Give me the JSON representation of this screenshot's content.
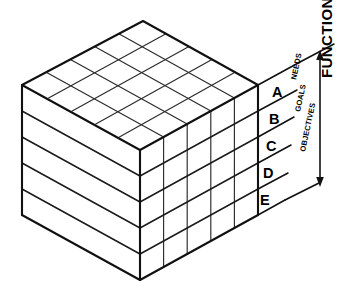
{
  "figure": {
    "background_color": "#ffffff",
    "line_color": "#111111"
  },
  "tier_labels": [
    {
      "id": "tier-a",
      "text": "A",
      "x": 272,
      "y": 97
    },
    {
      "id": "tier-b",
      "text": "B",
      "x": 269,
      "y": 124
    },
    {
      "id": "tier-c",
      "text": "C",
      "x": 266,
      "y": 151
    },
    {
      "id": "tier-d",
      "text": "D",
      "x": 263,
      "y": 178
    },
    {
      "id": "tier-e",
      "text": "E",
      "x": 260,
      "y": 205
    }
  ],
  "bracket_labels": [
    {
      "id": "label-needs",
      "text": "NEEDS",
      "x": 296,
      "y": 80
    },
    {
      "id": "label-goals",
      "text": "GOALS",
      "x": 300,
      "y": 112
    },
    {
      "id": "label-objectives",
      "text": "OBJECTIVES",
      "x": 305,
      "y": 146
    }
  ],
  "axis": {
    "title": "FUNCTIONS",
    "title_x": 328,
    "title_y": 92,
    "arrow_top": "up-arrow-icon",
    "arrow_bottom": "down-arrow-icon"
  },
  "geometry": {
    "top_face_cols": 5,
    "top_face_rows": 5,
    "right_face_cols": 5,
    "layers": 5,
    "apex_top": [
      143,
      21
    ],
    "left_vertex": [
      22,
      85
    ],
    "right_vertex": [
      258,
      85
    ],
    "front_vertex": [
      140,
      150
    ],
    "bottom_front_vertex": [
      140,
      280
    ],
    "bottom_left_vertex": [
      22,
      215
    ],
    "bottom_right_vertex": [
      258,
      215
    ]
  },
  "colors": {
    "stroke": "#111111",
    "fill": "#ffffff",
    "minor_stroke": "#2a2a2a"
  }
}
